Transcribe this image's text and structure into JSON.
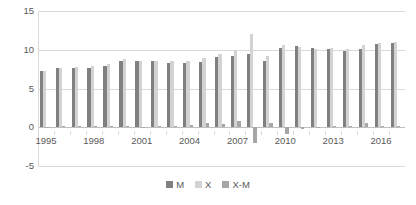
{
  "chart_data": {
    "type": "bar",
    "title": "",
    "subtitle": "",
    "xlabel": "",
    "ylabel": "",
    "ylim": [
      -5,
      15
    ],
    "yticks": [
      15,
      10,
      5,
      0,
      -5
    ],
    "grid": true,
    "legend_position": "bottom",
    "categories": [
      "1995",
      "1996",
      "1997",
      "1998",
      "1999",
      "2000",
      "2001",
      "2002",
      "2003",
      "2004",
      "2005",
      "2006",
      "2007",
      "2008",
      "2009",
      "2010",
      "2011",
      "2012",
      "2013",
      "2014",
      "2015",
      "2016",
      "2017"
    ],
    "xtick_labels": [
      "1995",
      "1998",
      "2001",
      "2004",
      "2007",
      "2010",
      "2013",
      "2016"
    ],
    "series": [
      {
        "name": "M",
        "color": "#808080",
        "values": [
          7.2,
          7.6,
          7.7,
          7.7,
          7.9,
          8.6,
          8.6,
          8.5,
          8.3,
          8.3,
          8.4,
          9.1,
          9.2,
          9.5,
          8.6,
          10.2,
          10.5,
          10.2,
          10.1,
          9.9,
          10.1,
          10.8,
          10.9
        ]
      },
      {
        "name": "X",
        "color": "#d3d3d3",
        "values": [
          7.2,
          7.7,
          7.8,
          7.9,
          8.1,
          8.8,
          8.6,
          8.6,
          8.5,
          8.6,
          9.0,
          9.5,
          10.0,
          12.0,
          9.2,
          10.6,
          10.3,
          10.1,
          10.2,
          10.1,
          10.6,
          10.9,
          11.0
        ]
      },
      {
        "name": "X-M",
        "color": "#a6a6a6",
        "values": [
          0.0,
          0.1,
          0.1,
          0.2,
          0.2,
          0.2,
          0.0,
          0.1,
          0.2,
          0.3,
          0.6,
          0.4,
          0.8,
          -2.0,
          0.6,
          -0.9,
          -0.2,
          -0.1,
          0.1,
          0.2,
          0.5,
          0.1,
          0.1
        ]
      }
    ]
  },
  "legend": {
    "items": [
      {
        "label": "M",
        "color": "#808080"
      },
      {
        "label": "X",
        "color": "#d3d3d3"
      },
      {
        "label": "X-M",
        "color": "#a6a6a6"
      }
    ]
  }
}
